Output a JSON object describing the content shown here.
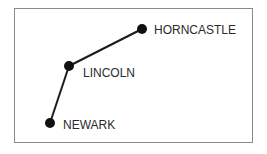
{
  "diagram": {
    "type": "route-map",
    "colors": {
      "line": "#1a1a1a",
      "node": "#111111",
      "text": "#2a2a2a",
      "frame": "#8a8a8a"
    },
    "nodes": [
      {
        "id": "horncastle",
        "label": "HORNCASTLE",
        "x": 142,
        "y": 29
      },
      {
        "id": "lincoln",
        "label": "LINCOLN",
        "x": 69,
        "y": 66
      },
      {
        "id": "newark",
        "label": "NEWARK",
        "x": 50,
        "y": 123
      }
    ],
    "edges": [
      {
        "from": "newark",
        "to": "lincoln"
      },
      {
        "from": "lincoln",
        "to": "horncastle"
      }
    ]
  }
}
